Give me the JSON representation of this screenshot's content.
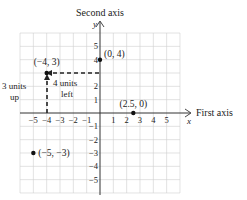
{
  "chart_data": {
    "type": "scatter",
    "title": "",
    "axis_labels": {
      "y_title": "Second axis",
      "y_var": "y",
      "x_title": "First axis",
      "x_var": "x"
    },
    "xlim": [
      -6,
      6
    ],
    "ylim": [
      -6,
      6
    ],
    "x_ticks": [
      "−5",
      "−4",
      "−3",
      "−2",
      "−1",
      "1",
      "2",
      "3",
      "4",
      "5"
    ],
    "y_ticks": [
      "5",
      "4",
      "2",
      "1",
      "−1",
      "−2",
      "−3",
      "−4",
      "−5"
    ],
    "points": [
      {
        "x": 0,
        "y": 4,
        "label": "(0, 4)"
      },
      {
        "x": -4,
        "y": 3,
        "label": "(−4, 3)"
      },
      {
        "x": 2.5,
        "y": 0,
        "label": "(2.5, 0)"
      },
      {
        "x": -5,
        "y": -3,
        "label": "(−5, −3)"
      }
    ],
    "annotations": {
      "up_line1": "3 units",
      "up_line2": "up",
      "left_line1": "4 units",
      "left_line2": "left"
    },
    "grid": true
  }
}
